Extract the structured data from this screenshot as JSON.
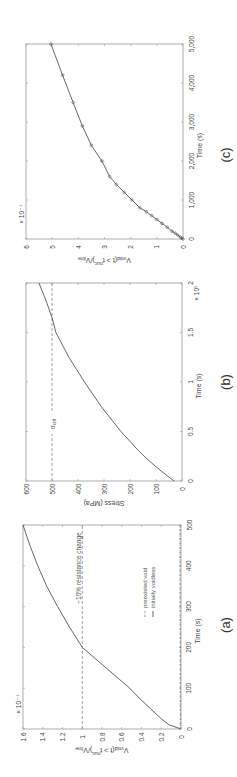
{
  "figure": {
    "panels": [
      "(a)",
      "(b)",
      "(c)"
    ]
  },
  "chart_data": [
    {
      "id": "a",
      "panel_label": "(a)",
      "type": "line",
      "xlabel": "Time (s)",
      "ylabel": "V_void(t > t_nuc)/V_line",
      "ylabel_main": "V",
      "ylabel_sub1": "void",
      "ylabel_mid": "(t > t",
      "ylabel_sub2": "nuc",
      "ylabel_end": ")/V",
      "ylabel_sub3": "line",
      "y_multiplier": "× 10⁻⁴",
      "xlim": [
        0,
        500
      ],
      "ylim": [
        0,
        1.6
      ],
      "xticks": [
        0,
        100,
        200,
        300,
        400,
        500
      ],
      "xtick_labels": [
        "0",
        "100",
        "200",
        "300",
        "400",
        "500"
      ],
      "yticks": [
        0,
        0.2,
        0.4,
        0.6,
        0.8,
        1,
        1.2,
        1.4,
        1.6
      ],
      "ytick_labels": [
        "0",
        "0.2",
        "0.4",
        "0.6",
        "0.8",
        "1",
        "1.2",
        "1.4",
        "1.6"
      ],
      "series": [
        {
          "name": "preexisted void",
          "style": "dash-dot",
          "x": [
            0,
            100,
            200,
            300,
            400,
            500
          ],
          "y": [
            0.005,
            0.006,
            0.007,
            0.008,
            0.009,
            0.01
          ]
        },
        {
          "name": "initially voidless",
          "style": "solid",
          "x": [
            0,
            10,
            25,
            50,
            75,
            100,
            150,
            200,
            250,
            300,
            350,
            400,
            450,
            500
          ],
          "y": [
            0,
            0.12,
            0.2,
            0.31,
            0.42,
            0.52,
            0.76,
            1.0,
            1.13,
            1.25,
            1.36,
            1.45,
            1.53,
            1.6
          ]
        }
      ],
      "hlines": [
        {
          "y": 1,
          "label": "−10% resistance change",
          "style": "dashed"
        }
      ],
      "legend": [
        "preexisted void",
        "initially voidless"
      ],
      "grid": false
    },
    {
      "id": "b",
      "panel_label": "(b)",
      "type": "line",
      "xlabel": "Time (s)",
      "ylabel": "Stress (MPa)",
      "x_multiplier": "× 10⁵",
      "xlim": [
        0,
        2
      ],
      "ylim": [
        0,
        600
      ],
      "xticks": [
        0,
        0.5,
        1,
        1.5,
        2
      ],
      "xtick_labels": [
        "0",
        "0.5",
        "1",
        "1.5",
        "2"
      ],
      "yticks": [
        0,
        100,
        200,
        300,
        400,
        500,
        600
      ],
      "ytick_labels": [
        "0",
        "100",
        "200",
        "300",
        "400",
        "500",
        "600"
      ],
      "series": [
        {
          "name": "stress",
          "style": "solid",
          "x": [
            0,
            0.05,
            0.1,
            0.2,
            0.3,
            0.5,
            0.75,
            1.0,
            1.25,
            1.5,
            1.65,
            1.8,
            2.0
          ],
          "y": [
            30,
            55,
            80,
            125,
            165,
            235,
            310,
            375,
            435,
            485,
            500,
            520,
            550
          ]
        }
      ],
      "hlines": [
        {
          "y": 500,
          "label": "σ_crit",
          "style": "dashed"
        }
      ],
      "annotation": {
        "main": "σ",
        "sub": "crit"
      },
      "grid": false
    },
    {
      "id": "c",
      "panel_label": "(c)",
      "type": "line",
      "xlabel": "Time (s)",
      "ylabel": "V_void(t > t_nuc)/V_line",
      "ylabel_main": "V",
      "ylabel_sub1": "void",
      "ylabel_mid": "(t > t",
      "ylabel_sub2": "nuc",
      "ylabel_end": ")/V",
      "ylabel_sub3": "line",
      "y_multiplier": "× 10⁻⁴",
      "xlim": [
        0,
        5000
      ],
      "ylim": [
        0,
        6
      ],
      "xticks": [
        0,
        1000,
        2000,
        3000,
        4000,
        5000
      ],
      "xtick_labels": [
        "0",
        "1,000",
        "2,000",
        "3,000",
        "4,000",
        "5,000"
      ],
      "yticks": [
        0,
        1,
        2,
        3,
        4,
        5,
        6
      ],
      "ytick_labels": [
        "0",
        "1",
        "2",
        "3",
        "4",
        "5",
        "6"
      ],
      "series": [
        {
          "name": "with markers",
          "style": "solid+circle",
          "x": [
            0,
            20,
            50,
            100,
            150,
            200,
            300,
            400,
            500,
            600,
            700,
            800,
            1000,
            1200,
            1400,
            1600,
            2000,
            2400,
            2900,
            3500,
            4200,
            5000
          ],
          "y": [
            0,
            0.05,
            0.1,
            0.2,
            0.3,
            0.42,
            0.6,
            0.8,
            1.0,
            1.2,
            1.4,
            1.65,
            1.95,
            2.25,
            2.55,
            2.8,
            3.1,
            3.5,
            3.85,
            4.2,
            4.6,
            5.05
          ]
        }
      ],
      "grid": false
    }
  ]
}
